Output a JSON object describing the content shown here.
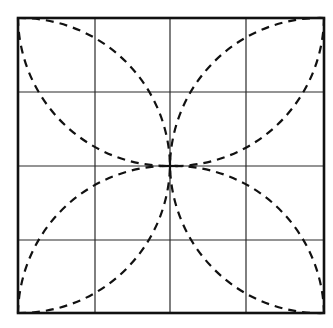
{
  "diagram": {
    "grid": {
      "rows": 4,
      "cols": 4
    },
    "colors": {
      "background": "#ffffff",
      "grid": "#2a2a2a",
      "border": "#111111",
      "arcs": "#111111"
    },
    "bounds": {
      "left": 18,
      "top": 18,
      "right": 324,
      "bottom": 313
    },
    "center": {
      "x": 170,
      "y": 166
    },
    "petals": [
      "top-left",
      "top-right",
      "bottom-left",
      "bottom-right"
    ]
  }
}
